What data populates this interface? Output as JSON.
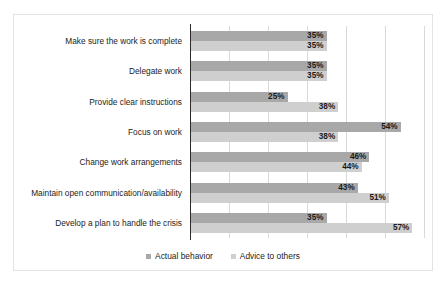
{
  "chart_data": {
    "type": "bar",
    "orientation": "horizontal",
    "title": "",
    "xlabel": "",
    "ylabel": "",
    "xlim": [
      0,
      60
    ],
    "grid": true,
    "gridline_interval": 10,
    "legend_position": "bottom",
    "value_suffix": "%",
    "categories": [
      "Make sure the work is complete",
      "Delegate work",
      "Provide clear instructions",
      "Focus on work",
      "Change work arrangements",
      "Maintain open communication/availability",
      "Develop a plan to handle the crisis"
    ],
    "series": [
      {
        "name": "Actual behavior",
        "color": "#a8a8a8",
        "values": [
          35,
          35,
          25,
          54,
          46,
          43,
          35
        ],
        "labels": [
          "35%",
          "35%",
          "25%",
          "54%",
          "46%",
          "43%",
          "35%"
        ]
      },
      {
        "name": "Advice to others",
        "color": "#cfcfcf",
        "values": [
          35,
          35,
          38,
          38,
          44,
          51,
          57
        ],
        "labels": [
          "35%",
          "35%",
          "38%",
          "38%",
          "44%",
          "51%",
          "57%"
        ]
      }
    ]
  },
  "legend": {
    "items": [
      {
        "label": "Actual behavior",
        "key": "actual"
      },
      {
        "label": "Advice to others",
        "key": "advice"
      }
    ]
  },
  "colors": {
    "actual": "#a8a8a8",
    "advice": "#cfcfcf",
    "gridline": "#d9d9d9",
    "axis": "#2b2b2b",
    "border": "#e3e3e3",
    "text": "#1c1c1c",
    "background": "#ffffff"
  }
}
